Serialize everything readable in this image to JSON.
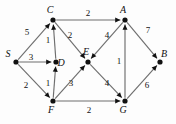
{
  "figure": {
    "kind": "directed-weighted-graph",
    "background_color": "#fdfdfd",
    "node_color": "#111111",
    "edge_color": "#6e6e6e",
    "label_color": "#111111"
  },
  "nodes": [
    {
      "id": "S",
      "label": "S",
      "x": 16,
      "y": 62,
      "label_dx": -8,
      "label_dy": -5
    },
    {
      "id": "C",
      "label": "C",
      "x": 53,
      "y": 20,
      "label_dx": -3,
      "label_dy": -7
    },
    {
      "id": "D",
      "label": "D",
      "x": 56,
      "y": 62,
      "label_dx": 5,
      "label_dy": 4
    },
    {
      "id": "F",
      "label": "F",
      "x": 53,
      "y": 101,
      "label_dx": -2,
      "label_dy": 12
    },
    {
      "id": "E",
      "label": "E",
      "x": 88,
      "y": 62,
      "label_dx": -2,
      "label_dy": -7
    },
    {
      "id": "A",
      "label": "A",
      "x": 125,
      "y": 20,
      "label_dx": -2,
      "label_dy": -7
    },
    {
      "id": "G",
      "label": "G",
      "x": 125,
      "y": 101,
      "label_dx": -2,
      "label_dy": 12
    },
    {
      "id": "B",
      "label": "B",
      "x": 160,
      "y": 62,
      "label_dx": 4,
      "label_dy": -5
    }
  ],
  "edges": [
    {
      "from": "S",
      "to": "C",
      "weight": "5",
      "wx": 27,
      "wy": 35
    },
    {
      "from": "S",
      "to": "D",
      "weight": "3",
      "wx": 31,
      "wy": 60
    },
    {
      "from": "S",
      "to": "F",
      "weight": "2",
      "wx": 26,
      "wy": 88
    },
    {
      "from": "D",
      "to": "C",
      "weight": "1",
      "wx": 48,
      "wy": 43
    },
    {
      "from": "F",
      "to": "D",
      "weight": "1",
      "wx": 48,
      "wy": 86
    },
    {
      "from": "C",
      "to": "A",
      "weight": "2",
      "wx": 88,
      "wy": 16
    },
    {
      "from": "C",
      "to": "E",
      "weight": "2",
      "wx": 70,
      "wy": 38
    },
    {
      "from": "A",
      "to": "E",
      "weight": "4",
      "wx": 107,
      "wy": 38
    },
    {
      "from": "F",
      "to": "E",
      "weight": "3",
      "wx": 71,
      "wy": 86
    },
    {
      "from": "E",
      "to": "G",
      "weight": "4",
      "wx": 107,
      "wy": 86
    },
    {
      "from": "F",
      "to": "G",
      "weight": "2",
      "wx": 89,
      "wy": 113
    },
    {
      "from": "G",
      "to": "A",
      "weight": "1",
      "wx": 119,
      "wy": 64
    },
    {
      "from": "A",
      "to": "B",
      "weight": "7",
      "wx": 148,
      "wy": 33
    },
    {
      "from": "G",
      "to": "B",
      "weight": "6",
      "wx": 147,
      "wy": 88
    }
  ]
}
